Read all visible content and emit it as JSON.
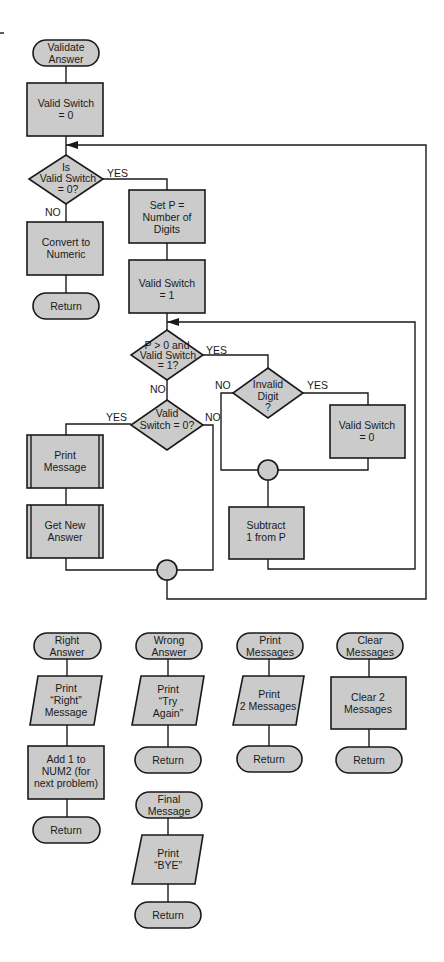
{
  "colors": {
    "fill": "#cbcbcb",
    "stroke": "#1a1a1a",
    "background": "#ffffff"
  },
  "main_flow": {
    "start": [
      "Validate",
      "Answer"
    ],
    "init_switch": [
      "Valid Switch",
      "= 0"
    ],
    "decision_switch": [
      "Is",
      "Valid Switch",
      "= 0?"
    ],
    "convert": [
      "Convert to",
      "Numeric"
    ],
    "return1": "Return",
    "set_p": [
      "Set P =",
      "Number of",
      "Digits"
    ],
    "set_switch_1": [
      "Valid Switch",
      "= 1"
    ],
    "decision_loop": [
      "P > 0 and",
      "Valid Switch",
      "= 1?"
    ],
    "decision_invalid": [
      "Invalid",
      "Digit",
      "?"
    ],
    "set_switch_0": [
      "Valid Switch",
      "= 0"
    ],
    "subtract": [
      "Subtract",
      "1 from P"
    ],
    "decision_valid0": [
      "Valid",
      "Switch = 0?"
    ],
    "print_message": [
      "Print",
      "Message"
    ],
    "get_new_answer": [
      "Get New",
      "Answer"
    ],
    "labels": {
      "yes": "YES",
      "no": "NO"
    }
  },
  "subroutines": [
    {
      "start": [
        "Right",
        "Answer"
      ],
      "steps": [
        [
          "Print",
          "“Right”",
          "Message"
        ],
        [
          "Add 1 to",
          "NUM2 (for",
          "next problem)"
        ]
      ],
      "end": "Return"
    },
    {
      "start": [
        "Wrong",
        "Answer"
      ],
      "steps": [
        [
          "Print",
          "“Try",
          "Again”"
        ]
      ],
      "end": "Return"
    },
    {
      "start": [
        "Print",
        "Messages"
      ],
      "steps": [
        [
          "Print",
          "2 Messages"
        ]
      ],
      "end": "Return"
    },
    {
      "start": [
        "Clear",
        "Messages"
      ],
      "steps": [
        [
          "Clear 2",
          "Messages"
        ]
      ],
      "end": "Return"
    },
    {
      "start": [
        "Final",
        "Message"
      ],
      "steps": [
        [
          "Print",
          "“BYE”"
        ]
      ],
      "end": "Return"
    }
  ]
}
